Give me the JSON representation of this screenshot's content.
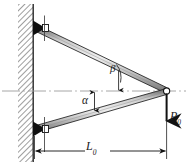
{
  "figure": {
    "background_color": "#ffffff",
    "line_color": "#1a1a1a",
    "member_fill_color": "#b8b8b8",
    "wall_hatch_color": "#555555",
    "centerline_color": "#9a9a9a"
  },
  "labels": {
    "alpha": "α",
    "beta": "β",
    "load_symbol": "P",
    "load_subscript": "0",
    "length_symbol": "L",
    "length_subscript": "0"
  },
  "elements": {
    "wall": "wall-hatched",
    "upper_member": "upper-bar",
    "lower_member": "lower-bar",
    "top_pin": "top-pin-support",
    "bottom_pin": "bottom-pin-support",
    "apex_pin": "apex-pin-joint",
    "load_arrow": "load-arrow-down",
    "centerline": "horizontal-centerline",
    "dimension_line": "dimension-line-L0",
    "angle_arc_alpha": "angle-arc-alpha",
    "angle_arc_beta": "angle-arc-beta"
  },
  "geometry": {
    "wall_x_left": 18,
    "wall_x_right": 33,
    "top_joint": [
      34,
      28
    ],
    "bottom_joint": [
      34,
      129
    ],
    "apex_joint": [
      166,
      91
    ],
    "centerline_y": 91,
    "dimension_y": 151,
    "load_arrow_tip_y": 127
  }
}
